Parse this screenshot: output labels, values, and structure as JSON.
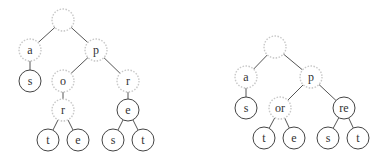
{
  "diagram": {
    "title": "",
    "style": {
      "edge_color": "#555555",
      "solid_node_stroke": "#444444",
      "dashed_node_stroke": "#c8c8c8",
      "background": "#ffffff"
    },
    "trees": [
      {
        "name": "trie",
        "nodes": [
          {
            "id": "root",
            "label": "",
            "x": 63,
            "y": 20,
            "style": "dashed"
          },
          {
            "id": "a",
            "label": "a",
            "x": 30,
            "y": 50,
            "style": "dashed"
          },
          {
            "id": "p",
            "label": "p",
            "x": 96,
            "y": 50,
            "style": "dashed"
          },
          {
            "id": "a_s",
            "label": "s",
            "x": 30,
            "y": 81,
            "style": "solid"
          },
          {
            "id": "o",
            "label": "o",
            "x": 63,
            "y": 81,
            "style": "dashed"
          },
          {
            "id": "r1",
            "label": "r",
            "x": 128,
            "y": 81,
            "style": "dashed"
          },
          {
            "id": "r2",
            "label": "r",
            "x": 63,
            "y": 110,
            "style": "dashed"
          },
          {
            "id": "e1",
            "label": "e",
            "x": 128,
            "y": 110,
            "style": "solid"
          },
          {
            "id": "t1",
            "label": "t",
            "x": 48,
            "y": 140,
            "style": "solid"
          },
          {
            "id": "e2",
            "label": "e",
            "x": 78,
            "y": 140,
            "style": "solid"
          },
          {
            "id": "s2",
            "label": "s",
            "x": 113,
            "y": 140,
            "style": "solid"
          },
          {
            "id": "t2",
            "label": "t",
            "x": 143,
            "y": 140,
            "style": "solid"
          }
        ],
        "edges": [
          [
            "root",
            "a"
          ],
          [
            "root",
            "p"
          ],
          [
            "a",
            "a_s"
          ],
          [
            "p",
            "o"
          ],
          [
            "p",
            "r1"
          ],
          [
            "o",
            "r2"
          ],
          [
            "r1",
            "e1"
          ],
          [
            "r2",
            "t1"
          ],
          [
            "r2",
            "e2"
          ],
          [
            "e1",
            "s2"
          ],
          [
            "e1",
            "t2"
          ]
        ]
      },
      {
        "name": "radix-tree",
        "nodes": [
          {
            "id": "root",
            "label": "",
            "x": 275,
            "y": 47,
            "style": "dashed"
          },
          {
            "id": "a",
            "label": "a",
            "x": 246,
            "y": 77,
            "style": "dashed"
          },
          {
            "id": "p",
            "label": "p",
            "x": 311,
            "y": 77,
            "style": "dashed"
          },
          {
            "id": "a_s",
            "label": "s",
            "x": 246,
            "y": 108,
            "style": "solid"
          },
          {
            "id": "or",
            "label": "or",
            "x": 280,
            "y": 108,
            "style": "dashed"
          },
          {
            "id": "re",
            "label": "re",
            "x": 344,
            "y": 108,
            "style": "solid"
          },
          {
            "id": "t1",
            "label": "t",
            "x": 264,
            "y": 138,
            "style": "solid"
          },
          {
            "id": "e1",
            "label": "e",
            "x": 294,
            "y": 138,
            "style": "solid"
          },
          {
            "id": "s2",
            "label": "s",
            "x": 328,
            "y": 138,
            "style": "solid"
          },
          {
            "id": "t2",
            "label": "t",
            "x": 358,
            "y": 138,
            "style": "solid"
          }
        ],
        "edges": [
          [
            "root",
            "a"
          ],
          [
            "root",
            "p"
          ],
          [
            "a",
            "a_s"
          ],
          [
            "p",
            "or"
          ],
          [
            "p",
            "re"
          ],
          [
            "or",
            "t1"
          ],
          [
            "or",
            "e1"
          ],
          [
            "re",
            "s2"
          ],
          [
            "re",
            "t2"
          ]
        ]
      }
    ],
    "node_radius": 11
  }
}
